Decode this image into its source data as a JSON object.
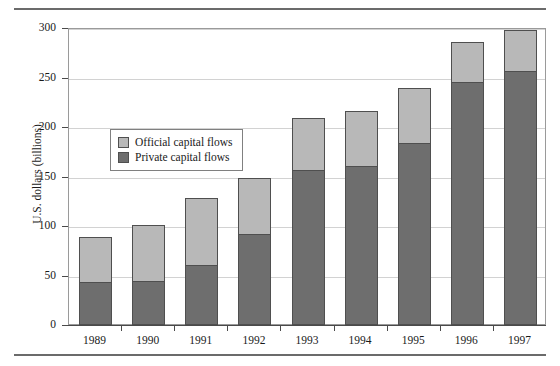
{
  "chart_data": {
    "type": "bar",
    "subtype": "stacked-bar",
    "title": "",
    "xlabel": "",
    "ylabel": "U.S. dollars (billions)",
    "ylim": [
      0,
      300
    ],
    "yticks": [
      0,
      50,
      100,
      150,
      200,
      250,
      300
    ],
    "grid": true,
    "legend_position": "inside-upper-left",
    "categories": [
      "1989",
      "1990",
      "1991",
      "1992",
      "1993",
      "1994",
      "1995",
      "1996",
      "1997"
    ],
    "series": [
      {
        "name": "Private capital flows",
        "color": "#6e6e6e",
        "values": [
          42,
          43,
          60,
          91,
          156,
          160,
          183,
          244,
          256
        ]
      },
      {
        "name": "Official capital flows",
        "color": "#b8b8b8",
        "values": [
          46,
          57,
          67,
          56,
          52,
          55,
          55,
          41,
          41
        ]
      }
    ],
    "totals": [
      88,
      100,
      127,
      147,
      208,
      215,
      238,
      285,
      297
    ]
  },
  "legend": {
    "entries": [
      {
        "label": "Official capital flows",
        "color": "#b8b8b8"
      },
      {
        "label": "Private capital flows",
        "color": "#6e6e6e"
      }
    ]
  },
  "axes": {
    "y_title": "U.S. dollars (billions)",
    "y_tick_labels": [
      "300",
      "250",
      "200",
      "150",
      "100",
      "50",
      "0"
    ],
    "x_tick_labels": [
      "1989",
      "1990",
      "1991",
      "1992",
      "1993",
      "1994",
      "1995",
      "1996",
      "1997"
    ]
  }
}
